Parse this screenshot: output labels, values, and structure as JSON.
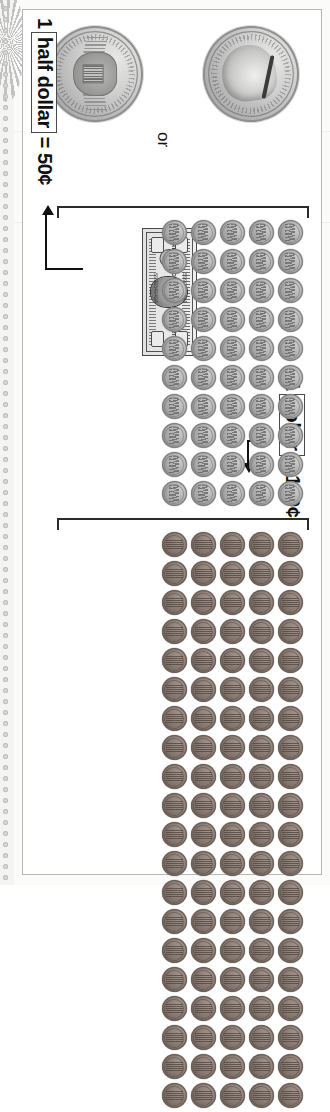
{
  "worksheet": {
    "title": "Money Equivalencies Chart",
    "background_color": "#ffffff",
    "sheet_border_color": "#b7b7b7"
  },
  "labels": {
    "dollar_equivalence": {
      "lead_number": "1",
      "boxed_word": "dollar",
      "equals": "=",
      "value": "100¢",
      "full_text": "1 dollar = 100¢"
    },
    "half_dollar_equivalence": {
      "lead_number": "1",
      "boxed_word": "half dollar",
      "value": "= 50¢",
      "full_text": "1 half dollar = 50¢"
    },
    "or_connector": "or"
  },
  "coin_groups": [
    {
      "name": "pennies-group",
      "coin_type": "penny",
      "columns": 5,
      "rows": 20,
      "count": 100,
      "represents": "100¢",
      "bracket": "left"
    },
    {
      "name": "nickels-group",
      "coin_type": "nickel",
      "columns": 5,
      "rows": 10,
      "count": 50,
      "represents": "50¢",
      "bracket": "right"
    }
  ],
  "currency_items": [
    {
      "name": "one-dollar-bill",
      "denomination": "1",
      "type": "banknote",
      "inscription": "THE UNITED STATES OF AMERICA",
      "corner_numeral": "1"
    },
    {
      "name": "half-dollar-obverse",
      "denomination": "50¢",
      "type": "coin",
      "side": "obverse",
      "inscription": "LIBERTY IN GOD WE TRUST",
      "date": "2000"
    },
    {
      "name": "half-dollar-reverse",
      "denomination": "50¢",
      "type": "coin",
      "side": "reverse",
      "inscription": "UNITED STATES OF AMERICA HALF DOLLAR"
    }
  ],
  "arrows": [
    {
      "name": "dollar-arrow",
      "direction": "right",
      "from": "dollar-label",
      "to": "pennies-group"
    },
    {
      "name": "half-dollar-arrow",
      "direction": "down",
      "from": "nickels-group",
      "to": "half-dollar-label"
    }
  ],
  "colors": {
    "penny": "#9d7b69",
    "nickel": "#b2b2b2",
    "half_dollar": "#cecece",
    "bill": "#deded8",
    "ink": "#111111",
    "bracket": "#2b2b2b"
  }
}
